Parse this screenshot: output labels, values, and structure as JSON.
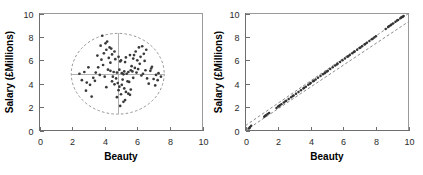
{
  "figure": {
    "background": "#ffffff",
    "panel_count": 2
  },
  "chart_data": [
    {
      "type": "scatter",
      "panel": "left",
      "title": "",
      "xlabel": "Beauty",
      "ylabel": "Salary (£Millions)",
      "xlim": [
        0,
        10
      ],
      "ylim": [
        0,
        10
      ],
      "xticks": [
        0,
        2,
        4,
        6,
        8,
        10
      ],
      "yticks": [
        0,
        2,
        4,
        6,
        8,
        10
      ],
      "xticklabels": [
        "0",
        "2",
        "4",
        "6",
        "8",
        "10"
      ],
      "yticklabels": [
        "0",
        "2",
        "4",
        "6",
        "8",
        "10"
      ],
      "grid": false,
      "legend": null,
      "marker_color": "#3a3a3a",
      "annotations": {
        "ellipse": {
          "label": "dashed data-concentration ellipse",
          "center_x": 4.8,
          "center_y": 4.85,
          "radius_x": 2.85,
          "radius_y": 3.45,
          "style": "dashed",
          "color": "#8a8a8a"
        },
        "crosshair": {
          "label": "mean crosshair",
          "vertical_x": 4.8,
          "horizontal_y": 4.85,
          "style": "solid",
          "color": "#a8a8a8"
        }
      },
      "x": [
        4.55,
        4.35,
        4.75,
        5.2,
        5.35,
        5.6,
        5.05,
        4.9,
        5.15,
        5.45,
        4.65,
        4.85,
        5.0,
        5.3,
        5.55,
        5.75,
        4.45,
        4.25,
        4.95,
        5.25,
        3.95,
        4.1,
        4.3,
        3.75,
        3.55,
        4.05,
        4.4,
        4.6,
        3.85,
        4.15,
        6.0,
        6.2,
        6.4,
        5.9,
        6.1,
        6.3,
        6.55,
        5.8,
        6.15,
        6.45,
        2.6,
        2.9,
        3.1,
        3.3,
        2.75,
        3.0,
        3.4,
        2.45,
        3.2,
        2.85,
        7.0,
        7.15,
        7.3,
        6.8,
        6.9,
        7.45,
        6.7,
        7.1,
        7.25,
        6.85,
        4.5,
        4.7,
        5.1,
        5.4,
        4.8,
        5.05,
        5.5,
        4.9,
        5.2,
        4.6,
        5.65,
        5.85,
        6.05,
        5.95,
        6.25,
        5.7,
        6.35,
        5.75,
        6.5,
        6.6,
        3.6,
        3.9,
        4.2,
        3.45,
        4.0,
        3.7,
        4.35,
        3.8,
        4.45,
        4.1,
        5.3,
        5.0,
        4.75,
        5.6,
        5.15,
        4.95,
        5.45,
        5.25,
        4.85,
        5.55
      ],
      "y": [
        5.0,
        5.1,
        4.95,
        5.05,
        4.85,
        5.15,
        4.9,
        5.2,
        4.8,
        5.0,
        6.1,
        6.3,
        6.0,
        6.25,
        6.45,
        6.15,
        6.5,
        6.2,
        5.9,
        5.85,
        6.6,
        6.9,
        7.1,
        7.25,
        6.4,
        7.45,
        7.0,
        6.75,
        8.1,
        7.6,
        6.0,
        6.3,
        6.55,
        6.75,
        7.1,
        7.2,
        6.9,
        6.45,
        5.7,
        5.95,
        4.3,
        4.1,
        3.9,
        4.5,
        5.0,
        5.4,
        4.25,
        4.85,
        2.9,
        3.4,
        4.4,
        4.75,
        4.9,
        5.1,
        5.45,
        4.6,
        4.0,
        3.85,
        4.3,
        5.3,
        4.6,
        4.45,
        4.35,
        4.2,
        4.05,
        3.9,
        4.15,
        3.75,
        3.6,
        3.95,
        5.5,
        5.35,
        5.25,
        4.95,
        4.7,
        5.05,
        4.85,
        4.5,
        5.15,
        4.45,
        5.4,
        5.6,
        5.2,
        4.95,
        4.6,
        4.75,
        5.8,
        6.05,
        4.2,
        3.7,
        3.3,
        3.1,
        2.85,
        3.5,
        2.45,
        2.1,
        3.15,
        2.6,
        3.45,
        3.05
      ]
    },
    {
      "type": "scatter",
      "panel": "right",
      "title": "",
      "xlabel": "Beauty",
      "ylabel": "Salary (£Millions)",
      "xlim": [
        0,
        10
      ],
      "ylim": [
        0,
        10
      ],
      "xticks": [
        0,
        2,
        4,
        6,
        8,
        10
      ],
      "yticks": [
        0,
        2,
        4,
        6,
        8,
        10
      ],
      "xticklabels": [
        "0",
        "2",
        "4",
        "6",
        "8",
        "10"
      ],
      "yticklabels": [
        "0",
        "2",
        "4",
        "6",
        "8",
        "10"
      ],
      "grid": false,
      "legend": null,
      "marker_color": "#343434",
      "annotations": {
        "upper_bound": {
          "label": "upper dashed bound",
          "style": "dashed",
          "slope": 1.02,
          "intercept": 0.42,
          "color": "#7d7d7d"
        },
        "lower_bound": {
          "label": "lower dashed bound",
          "style": "dashed",
          "slope": 0.96,
          "intercept": -0.3,
          "color": "#7d7d7d"
        },
        "relationship": "near-perfect positive linear association along y = x"
      },
      "x": [
        0.2,
        0.28,
        0.35,
        1.15,
        1.25,
        1.35,
        1.45,
        1.9,
        2.0,
        2.1,
        2.2,
        2.35,
        2.5,
        2.65,
        2.8,
        2.95,
        3.1,
        3.25,
        3.4,
        3.55,
        3.7,
        3.85,
        4.0,
        4.15,
        4.3,
        4.45,
        4.6,
        4.75,
        4.9,
        5.05,
        5.2,
        5.35,
        5.5,
        5.65,
        5.8,
        5.95,
        6.1,
        6.25,
        6.4,
        6.55,
        6.7,
        6.85,
        7.0,
        7.15,
        7.3,
        7.45,
        7.6,
        7.75,
        7.9,
        8.0,
        8.6,
        8.75,
        8.9,
        9.05,
        9.2,
        9.35,
        9.5,
        9.6,
        9.65,
        9.7,
        0.25,
        1.2,
        2.05,
        2.9,
        3.6,
        4.2,
        5.0,
        5.6,
        6.3,
        7.05,
        7.8,
        8.8,
        9.3,
        9.55,
        2.45,
        3.95,
        4.85,
        6.65,
        7.35,
        8.95
      ],
      "y": [
        0.18,
        0.3,
        0.4,
        1.18,
        1.3,
        1.4,
        1.5,
        1.92,
        2.05,
        2.15,
        2.25,
        2.4,
        2.55,
        2.7,
        2.85,
        3.0,
        3.15,
        3.3,
        3.45,
        3.6,
        3.75,
        3.9,
        4.05,
        4.2,
        4.35,
        4.5,
        4.65,
        4.8,
        4.95,
        5.1,
        5.25,
        5.4,
        5.55,
        5.7,
        5.85,
        6.0,
        6.15,
        6.3,
        6.45,
        6.6,
        6.75,
        6.9,
        7.05,
        7.2,
        7.35,
        7.5,
        7.65,
        7.8,
        7.95,
        8.05,
        8.68,
        8.85,
        9.0,
        9.15,
        9.3,
        9.45,
        9.6,
        9.7,
        9.72,
        9.78,
        0.22,
        1.25,
        2.08,
        2.95,
        3.65,
        4.25,
        5.05,
        5.65,
        6.35,
        7.1,
        7.85,
        8.9,
        9.4,
        9.65,
        2.5,
        4.0,
        4.9,
        6.7,
        7.4,
        9.05
      ]
    }
  ]
}
